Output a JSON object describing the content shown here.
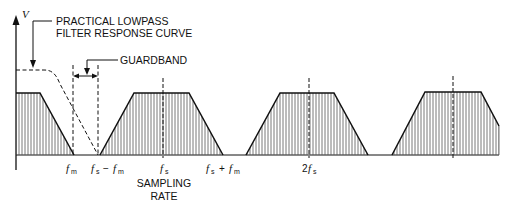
{
  "diagram": {
    "axis": {
      "y_label": "V"
    },
    "annotations": {
      "filter_line1": "PRACTICAL LOWPASS",
      "filter_line2": "FILTER RESPONSE CURVE",
      "guardband": "GUARDBAND",
      "sampling_line1": "SAMPLING",
      "sampling_line2": "RATE"
    },
    "ticks": {
      "fm": {
        "f": "f",
        "sub": "m"
      },
      "fs_minus_fm": {
        "f1": "f",
        "sub1": "s",
        "op": "−",
        "f2": "f",
        "sub2": "m"
      },
      "fs": {
        "f": "f",
        "sub": "s"
      },
      "fs_plus_fm": {
        "f1": "f",
        "sub1": "s",
        "op": "+",
        "f2": "f",
        "sub2": "m"
      },
      "two_fs": {
        "coef": "2",
        "f": "f",
        "sub": "s"
      }
    },
    "spectra": [
      {
        "name": "baseband",
        "center": "0"
      },
      {
        "name": "first-image",
        "center": "fs"
      },
      {
        "name": "second-image",
        "center": "2fs"
      },
      {
        "name": "third-image",
        "center": "3fs"
      }
    ],
    "colors": {
      "ink": "#111111",
      "hatch": "#555555",
      "background": "#ffffff"
    }
  }
}
